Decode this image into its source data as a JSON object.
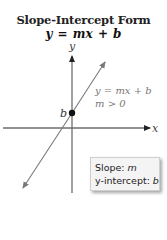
{
  "title": "Slope-Intercept Form",
  "equation": "y = mx + b",
  "axes": {
    "x_label": "x",
    "y_label": "y"
  },
  "line_label": {
    "equation": "y = mx + b",
    "condition": "m > 0"
  },
  "intercept_label": "b",
  "callout": {
    "slope_label": "Slope: ",
    "slope_var": "m",
    "intercept_label": "y-intercept: ",
    "intercept_var": "b"
  },
  "colors": {
    "axis": "#6e6e6e",
    "line": "#7a7a7a",
    "dot": "#111111",
    "label_gray": "#777777"
  }
}
